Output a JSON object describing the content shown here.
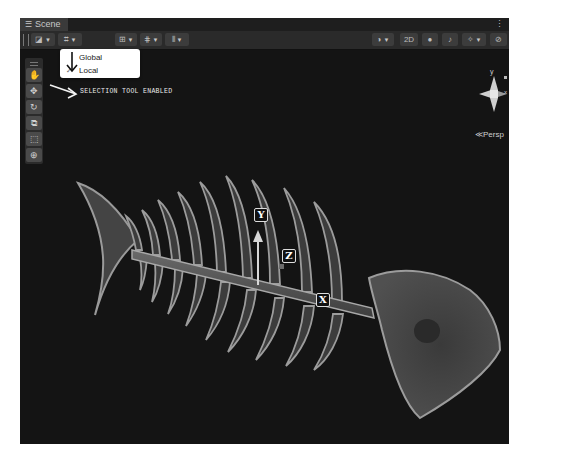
{
  "window": {
    "tab_label": "Scene",
    "tab_icon": "grid-icon",
    "menu_icon": "kebab-menu-icon"
  },
  "toolbar": {
    "left_buttons": [
      {
        "name": "draw-mode-button",
        "icon": "shaded-square-icon",
        "has_dropdown": true
      },
      {
        "name": "pivot-rotation-button",
        "icon": "local-gizmo-icon",
        "has_dropdown": true
      },
      {
        "name": "grid-snap-button",
        "icon": "grid-snap-icon",
        "has_dropdown": true
      },
      {
        "name": "increment-snap-button",
        "icon": "increment-snap-icon",
        "has_dropdown": true
      },
      {
        "name": "align-button",
        "icon": "align-icon",
        "has_dropdown": true
      }
    ],
    "right_buttons": [
      {
        "name": "shading-mode-button",
        "icon": "sphere-icon",
        "has_dropdown": true
      },
      {
        "name": "2d-toggle",
        "label": "2D"
      },
      {
        "name": "lighting-toggle",
        "icon": "lightbulb-icon"
      },
      {
        "name": "audio-toggle",
        "icon": "speaker-icon"
      },
      {
        "name": "effects-button",
        "icon": "effects-icon",
        "has_dropdown": true
      },
      {
        "name": "hidden-objects-toggle",
        "icon": "eye-slash-icon"
      },
      {
        "name": "camera-button",
        "icon": "camera-icon",
        "has_dropdown": true
      },
      {
        "name": "gizmos-button",
        "icon": "gizmo-globe-icon",
        "has_dropdown": true
      }
    ],
    "two_d_label": "2D"
  },
  "dropdown": {
    "items": [
      {
        "label": "Global",
        "checked": false
      },
      {
        "label": "Local",
        "checked": true
      }
    ],
    "check_glyph": "✓"
  },
  "tools_overlay": {
    "items": [
      {
        "name": "view-tool",
        "icon": "hand-icon",
        "glyph": "✋"
      },
      {
        "name": "move-tool",
        "icon": "move-arrows-icon",
        "glyph": "✥"
      },
      {
        "name": "rotate-tool",
        "icon": "rotate-icon",
        "glyph": "↻"
      },
      {
        "name": "scale-tool",
        "icon": "scale-icon",
        "glyph": "⧉"
      },
      {
        "name": "rect-tool",
        "icon": "rect-transform-icon",
        "glyph": "⬚"
      },
      {
        "name": "transform-tool",
        "icon": "transform-icon",
        "glyph": "⊕"
      }
    ]
  },
  "annotation": {
    "text": "SELECTION TOOL ENABLED"
  },
  "orientation_gizmo": {
    "y_label": "y",
    "x_label": "x",
    "projection_label": "Persp",
    "projection_glyph": "≪"
  },
  "scene_axes": {
    "labels": [
      "Y",
      "Z",
      "X"
    ]
  }
}
